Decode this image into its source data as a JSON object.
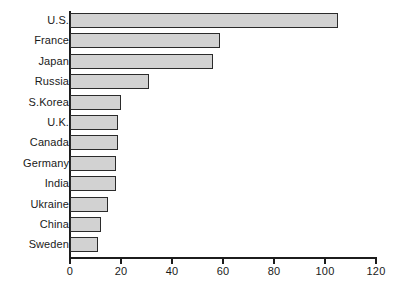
{
  "chart_data": {
    "type": "bar",
    "orientation": "horizontal",
    "title": "",
    "xlabel": "",
    "ylabel": "",
    "categories": [
      "U.S.",
      "France",
      "Japan",
      "Russia",
      "S.Korea",
      "U.K.",
      "Canada",
      "Germany",
      "India",
      "Ukraine",
      "China",
      "Sweden"
    ],
    "values": [
      105,
      59,
      56,
      31,
      20,
      19,
      19,
      18,
      18,
      15,
      12,
      11
    ],
    "xlim": [
      0,
      120
    ],
    "xticks": [
      0,
      20,
      40,
      60,
      80,
      100,
      120
    ],
    "xtick_labels": [
      "0",
      "20",
      "40",
      "60",
      "80",
      "100",
      "120"
    ],
    "grid": false,
    "legend": null,
    "bar_fill_color": "#d2d2d2",
    "bar_border_color": "#2b2b2b",
    "axis_color": "#1c1c1c"
  }
}
